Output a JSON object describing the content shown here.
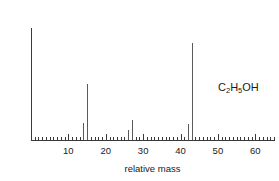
{
  "chart_data": {
    "type": "bar",
    "title": "",
    "subtitle": "",
    "xlabel": "relative mass",
    "ylabel": "relative abundance",
    "xlim": [
      0,
      65
    ],
    "ylim": [
      0,
      100
    ],
    "grid": false,
    "legend": "none",
    "x_tick_labels": [
      "10",
      "20",
      "30",
      "40",
      "50",
      "60"
    ],
    "x_tick_values": [
      10,
      20,
      30,
      40,
      50,
      60
    ],
    "x_minor_tick_interval": 1,
    "y_tick_labels": [],
    "x": [
      14,
      15,
      26,
      27,
      42,
      43
    ],
    "values": [
      18,
      58,
      10,
      21,
      16,
      100
    ],
    "series": [
      {
        "name": "relative abundance",
        "values": [
          18,
          58,
          10,
          21,
          16,
          100
        ]
      }
    ],
    "peaks": [
      {
        "mass": 14,
        "abundance": 18
      },
      {
        "mass": 15,
        "abundance": 58
      },
      {
        "mass": 26,
        "abundance": 10
      },
      {
        "mass": 27,
        "abundance": 21
      },
      {
        "mass": 42,
        "abundance": 16
      },
      {
        "mass": 43,
        "abundance": 100
      }
    ],
    "annotations": [
      {
        "name": "molecular-formula",
        "text": "C2H5OH",
        "x": 55,
        "y": 62
      }
    ],
    "colors": {
      "axis": "#3a3a3a",
      "peak": "#5a5a5a",
      "text": "#1a1a1a",
      "background": "#ffffff"
    }
  },
  "formula": {
    "part1": "C",
    "sub1": "2",
    "part2": "H",
    "sub2": "5",
    "part3": "OH"
  }
}
